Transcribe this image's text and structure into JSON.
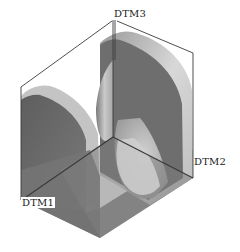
{
  "diagram": {
    "type": "3d-cad-part",
    "datum_labels": {
      "dtm1": "DTM1",
      "dtm2": "DTM2",
      "dtm3": "DTM3"
    },
    "colors": {
      "background": "#ffffff",
      "datum_line": "#3a3a3a",
      "face_dark": "#6e6e6e",
      "face_mid": "#8c8c8c",
      "face_light": "#c8c8c8",
      "face_highlight": "#dcdcdc",
      "label_text": "#1a1a1a"
    }
  }
}
